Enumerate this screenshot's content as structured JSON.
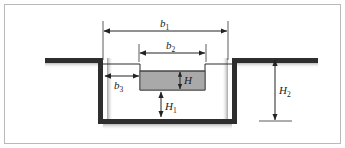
{
  "figure": {
    "kind": "engineering-cross-section",
    "background_color": "#ffffff",
    "border_color": "#b9b9b9"
  },
  "geometry": {
    "ground_color": "#2e2e2e",
    "outline_color": "#2b2b2b",
    "water_fill_color": "#a9a9a9",
    "water_outline_color": "#4a4a4a",
    "shadow_color": "#9a9a9a",
    "left_ground_x1": 45,
    "left_ground_x2": 103,
    "right_ground_x1": 232,
    "right_ground_x2": 318,
    "ground_y": 58,
    "bench_y": 64,
    "notch_left_x": 140,
    "notch_right_x": 205,
    "channel_floor_y": 119,
    "water_top_y": 71,
    "water_bottom_y": 90
  },
  "dimensions": [
    {
      "id": "b1",
      "symbol": "b",
      "subscript": "1",
      "orientation": "horizontal",
      "meaning": "total top width of compound channel"
    },
    {
      "id": "b2",
      "symbol": "b",
      "subscript": "2",
      "orientation": "horizontal",
      "meaning": "width of the low-flow notch"
    },
    {
      "id": "b3",
      "symbol": "b",
      "subscript": "3",
      "orientation": "horizontal",
      "meaning": "width of the left bench / floodplain"
    },
    {
      "id": "H",
      "symbol": "H",
      "subscript": "",
      "orientation": "vertical",
      "meaning": "depth of water above notch"
    },
    {
      "id": "H1",
      "symbol": "H",
      "subscript": "1",
      "orientation": "vertical",
      "meaning": "depth from water block bottom to channel floor"
    },
    {
      "id": "H2",
      "symbol": "H",
      "subscript": "2",
      "orientation": "vertical",
      "meaning": "total depth from ground surface to channel floor"
    }
  ]
}
